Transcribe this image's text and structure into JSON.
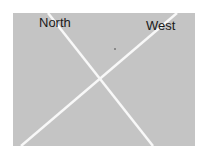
{
  "image": {
    "background_color": "#c4c4c4",
    "line_color": "#ffffff",
    "labels": {
      "left": "North",
      "right": "West"
    }
  }
}
